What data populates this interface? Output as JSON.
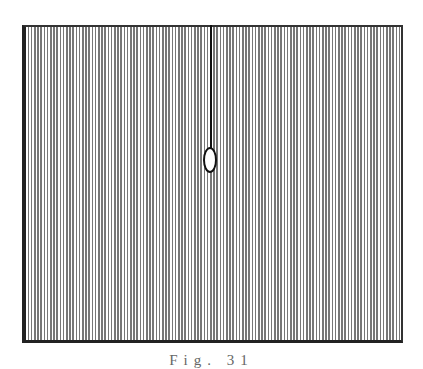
{
  "figure": {
    "caption": "Fig. 31",
    "colors": {
      "line": "#111111",
      "hatch": "#777777",
      "background": "#ffffff"
    }
  }
}
